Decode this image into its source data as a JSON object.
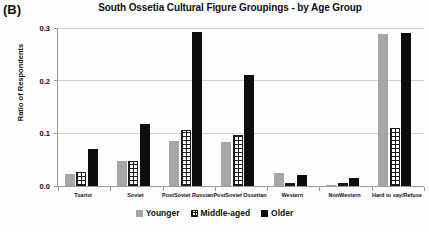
{
  "panel": {
    "label": "(B)"
  },
  "chart_data": {
    "type": "bar",
    "title": "South Ossetia Cultural Figure Groupings - by Age Group",
    "xlabel": "",
    "ylabel": "Ratio of Respondents",
    "ylim": [
      0,
      0.3
    ],
    "ytick_labels": [
      "0.0",
      "0.1",
      "0.2",
      "0.3"
    ],
    "ytick_values": [
      0.0,
      0.1,
      0.2,
      0.3
    ],
    "grid": true,
    "legend_position": "bottom",
    "categories": [
      "Tsarist",
      "Soviet",
      "PostSoviet Russian",
      "PostSoviet Ossetian",
      "Western",
      "NonWestern",
      "Hard to say/Refuse"
    ],
    "series": [
      {
        "name": "Younger",
        "color": "#a6a6a6",
        "pattern": "solid",
        "values": [
          0.022,
          0.048,
          0.086,
          0.084,
          0.024,
          0.002,
          0.288
        ]
      },
      {
        "name": "Middle-aged",
        "color": "#1a1a1a",
        "pattern": "crosshatch",
        "values": [
          0.027,
          0.048,
          0.107,
          0.096,
          0.005,
          0.005,
          0.111
        ]
      },
      {
        "name": "Older",
        "color": "#0d0d0d",
        "pattern": "solid",
        "values": [
          0.071,
          0.117,
          0.293,
          0.21,
          0.021,
          0.016,
          0.29
        ]
      }
    ]
  }
}
